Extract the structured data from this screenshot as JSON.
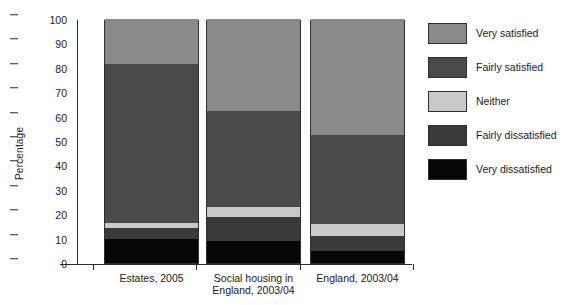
{
  "title_remnant": "",
  "axis": {
    "ylabel": "Percentage",
    "yticks": [
      "0",
      "10",
      "20",
      "30",
      "40",
      "50",
      "60",
      "70",
      "80",
      "90",
      "100"
    ]
  },
  "legend": {
    "items": [
      {
        "label": "Very satisfied",
        "color": "#8a8a8a"
      },
      {
        "label": "Fairly satisfied",
        "color": "#4a4a4a"
      },
      {
        "label": "Neither",
        "color": "#c9c9c9"
      },
      {
        "label": "Fairly dissatisfied",
        "color": "#3a3a3a"
      },
      {
        "label": "Very dissatisfied",
        "color": "#070707"
      }
    ]
  },
  "chart_data": {
    "type": "bar",
    "stacked": true,
    "title": "",
    "xlabel": "",
    "ylabel": "Percentage",
    "ylim": [
      0,
      100
    ],
    "ytick_step": 10,
    "grid": false,
    "legend_position": "right",
    "categories": [
      "Estates, 2005",
      "Social housing in\nEngland, 2003/04",
      "England, 2003/04"
    ],
    "series": [
      {
        "name": "Very dissatisfied",
        "color": "#070707",
        "values": [
          10,
          9,
          5
        ]
      },
      {
        "name": "Fairly dissatisfied",
        "color": "#3a3a3a",
        "values": [
          4.5,
          10,
          6
        ]
      },
      {
        "name": "Neither",
        "color": "#c9c9c9",
        "values": [
          2,
          4,
          5
        ]
      },
      {
        "name": "Fairly satisfied",
        "color": "#4a4a4a",
        "values": [
          65,
          39.5,
          36.5
        ]
      },
      {
        "name": "Very satisfied",
        "color": "#8a8a8a",
        "values": [
          18.5,
          37.5,
          47.5
        ]
      }
    ]
  }
}
